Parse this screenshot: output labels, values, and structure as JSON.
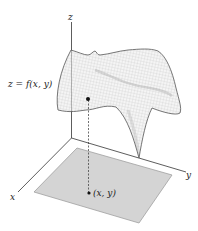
{
  "figure": {
    "axes": {
      "x_label": "x",
      "y_label": "y",
      "z_label": "z"
    },
    "surface_label": "z = f(x, y)",
    "domain_point_label": "(x, y)",
    "colors": {
      "axis": "#333333",
      "surface_fill": "#f4f4f4",
      "surface_mesh": "#bdbdbd",
      "surface_edge": "#555555",
      "domain_fill": "#d4d4d4",
      "domain_edge": "#9a9a9a",
      "point": "#111111"
    }
  }
}
